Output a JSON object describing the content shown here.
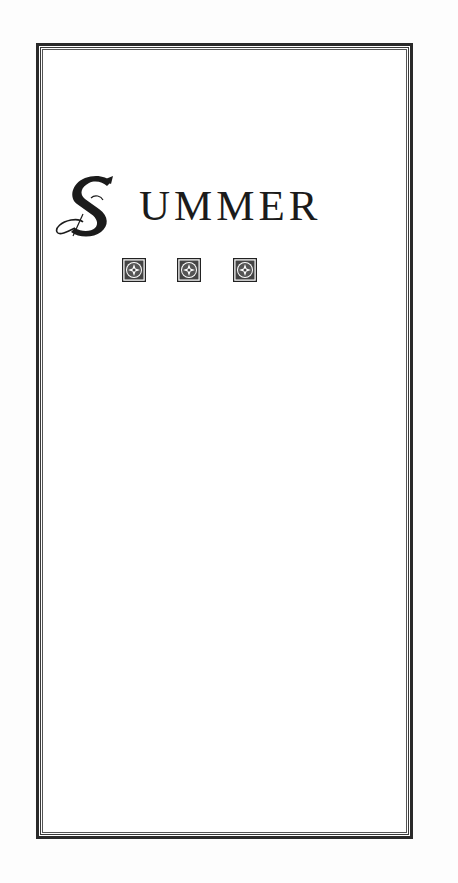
{
  "page": {
    "title": {
      "drop_cap": "S",
      "rest": "UMMER",
      "full": "SUMMER"
    },
    "ornaments": [
      {
        "icon": "floral-square-ornament-icon"
      },
      {
        "icon": "floral-square-ornament-icon"
      },
      {
        "icon": "floral-square-ornament-icon"
      }
    ],
    "colors": {
      "ink": "#1b1b1b",
      "border": "#2a2a2a",
      "paper": "#ffffff"
    }
  }
}
